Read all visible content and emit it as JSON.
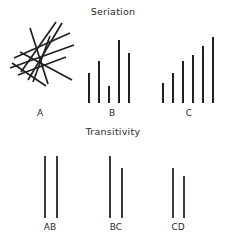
{
  "figure": {
    "width": 226,
    "height": 239,
    "background": "#ffffff",
    "ink_color": "#231f20",
    "text_color": "#2b2b2b"
  },
  "sections": {
    "seriation": {
      "title": "Seriation"
    },
    "transitivity": {
      "title": "Transitivity"
    }
  },
  "labels": {
    "a": "A",
    "b": "B",
    "c": "C",
    "ab": "AB",
    "bc": "BC",
    "cd": "CD"
  },
  "chart_data": {
    "type": "bar",
    "title": "Seriation",
    "subtitle": "Transitivity",
    "xlabel": "",
    "ylabel": "",
    "grid": false,
    "legend": "none",
    "panels": [
      {
        "name": "A",
        "label": "A",
        "kind": "scribble",
        "description": "disordered jumble of crossing straight line segments",
        "segments": [
          {
            "x1": 14,
            "y1": 58,
            "x2": 70,
            "y2": 33
          },
          {
            "x1": 10,
            "y1": 68,
            "x2": 74,
            "y2": 45
          },
          {
            "x1": 18,
            "y1": 75,
            "x2": 66,
            "y2": 57
          },
          {
            "x1": 28,
            "y1": 80,
            "x2": 62,
            "y2": 23
          },
          {
            "x1": 21,
            "y1": 72,
            "x2": 56,
            "y2": 22
          },
          {
            "x1": 33,
            "y1": 82,
            "x2": 50,
            "y2": 36
          },
          {
            "x1": 12,
            "y1": 63,
            "x2": 46,
            "y2": 86
          },
          {
            "x1": 20,
            "y1": 52,
            "x2": 72,
            "y2": 80
          },
          {
            "x1": 30,
            "y1": 28,
            "x2": 48,
            "y2": 84
          }
        ]
      },
      {
        "name": "B",
        "label": "B",
        "kind": "bars",
        "description": "five vertical bars of unordered varying heights on a common baseline",
        "baseline_y": 103,
        "bars": [
          {
            "x": 88,
            "height": 30
          },
          {
            "x": 98,
            "height": 42
          },
          {
            "x": 108,
            "height": 17
          },
          {
            "x": 118,
            "height": 63
          },
          {
            "x": 128,
            "height": 50
          }
        ],
        "values": [
          30,
          42,
          17,
          63,
          50
        ]
      },
      {
        "name": "C",
        "label": "C",
        "kind": "bars",
        "description": "six vertical bars ordered in ascending height on a common baseline",
        "baseline_y": 103,
        "bars": [
          {
            "x": 162,
            "height": 20
          },
          {
            "x": 172,
            "height": 30
          },
          {
            "x": 182,
            "height": 42
          },
          {
            "x": 192,
            "height": 48
          },
          {
            "x": 202,
            "height": 57
          },
          {
            "x": 212,
            "height": 66
          }
        ],
        "values": [
          20,
          30,
          42,
          48,
          57,
          66
        ]
      },
      {
        "name": "AB",
        "label": "AB",
        "kind": "pair",
        "description": "two vertical lines of equal length",
        "baseline_y": 218,
        "lines": [
          {
            "x": 44,
            "height": 62
          },
          {
            "x": 56,
            "height": 62
          }
        ],
        "values": [
          62,
          62
        ]
      },
      {
        "name": "BC",
        "label": "BC",
        "kind": "pair",
        "description": "two vertical lines, left longer than right",
        "baseline_y": 218,
        "lines": [
          {
            "x": 109,
            "height": 62
          },
          {
            "x": 121,
            "height": 50
          }
        ],
        "values": [
          62,
          50
        ]
      },
      {
        "name": "CD",
        "label": "CD",
        "kind": "pair",
        "description": "two vertical lines, left longer than right, both shorter than BC",
        "baseline_y": 218,
        "lines": [
          {
            "x": 172,
            "height": 50
          },
          {
            "x": 183,
            "height": 42
          }
        ],
        "values": [
          50,
          42
        ]
      }
    ],
    "label_positions": {
      "a": {
        "x": 40,
        "y": 108
      },
      "b": {
        "x": 112,
        "y": 108
      },
      "c": {
        "x": 189,
        "y": 108
      },
      "ab": {
        "x": 50,
        "y": 222
      },
      "bc": {
        "x": 116,
        "y": 222
      },
      "cd": {
        "x": 178,
        "y": 222
      }
    }
  }
}
